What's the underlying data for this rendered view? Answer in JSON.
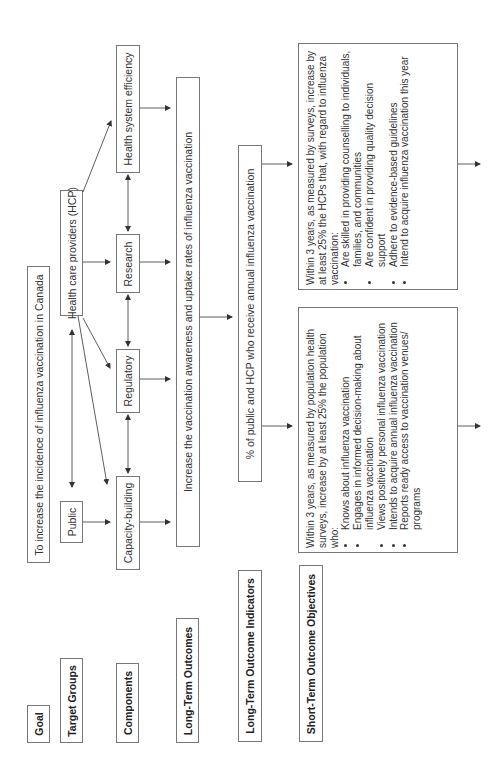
{
  "diagram": {
    "orientation": "rotated-90-ccw",
    "row_labels": {
      "goal": "Goal",
      "target_groups": "Target Groups",
      "components": "Components",
      "long_term_outcomes": "Long-Term Outcomes",
      "long_term_indicators": "Long-Term Outcome Indicators",
      "short_term_objectives": "Short-Term Outcome Objectives"
    },
    "goal": "To increase the incidence of influenza vaccination in Canada",
    "target_groups": {
      "public": "Public",
      "hcp": "Health care providers (HCP)"
    },
    "components": {
      "capacity_building": "Capacity-building",
      "regulatory": "Regulatory",
      "research": "Research",
      "health_system_efficiency": "Health system efficiency"
    },
    "long_term_outcome": "Increase the vaccination awareness and uptake rates of influenza vaccination",
    "long_term_indicator": "% of public and HCP who receive annual influenza vaccination",
    "short_term_objectives": {
      "public": {
        "intro": "Within 3 years, as measured by population health surveys, increase by at least 25% the population who:",
        "items": [
          "Knows about influenza vaccination",
          "Engages in informed decision-making about influenza vaccination",
          "Views positively personal influenza vaccination",
          "Intends to acquire annual influenza vaccination",
          "Reports ready access to vaccination venues/ programs"
        ]
      },
      "hcp": {
        "intro": "Within 3 years, as measured by surveys, increase by at least 25% the HCPs that, with regard to influenza vaccination:",
        "items": [
          "Are skilled in providing counselling to individuals, families, and communities",
          "Are confident in providing quality decision support",
          "Adhere to evidence-based guidelines",
          "Intend to acquire influenza vaccination this year"
        ]
      }
    },
    "colors": {
      "border": "#777777",
      "arrow": "#333333",
      "text": "#333333"
    }
  }
}
